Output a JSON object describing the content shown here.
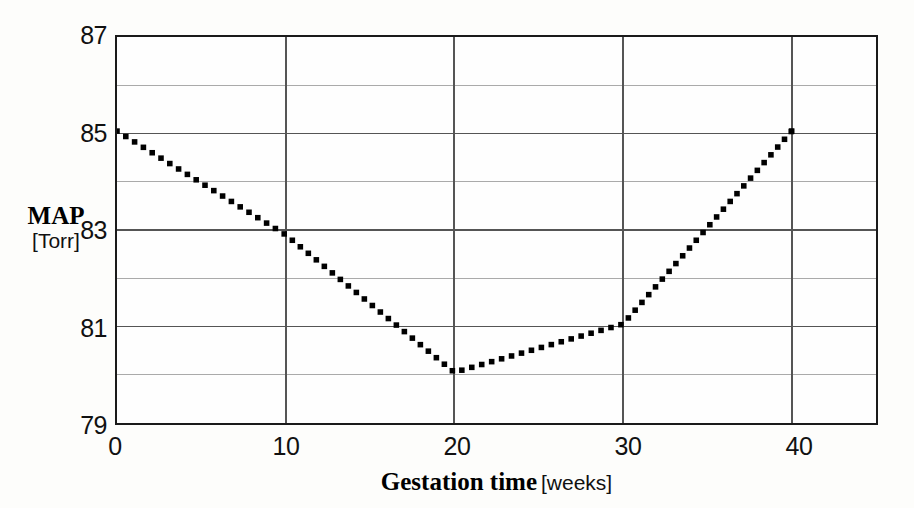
{
  "chart_data": {
    "type": "line",
    "title": "",
    "subtitle": "",
    "xlabel": "Gestation time",
    "xunit": "[weeks]",
    "ylabel": "MAP",
    "yunit": "[Torr]",
    "x": [
      0,
      10,
      20,
      30,
      40
    ],
    "values": [
      85.05,
      82.9,
      80.05,
      81.05,
      85.05
    ],
    "series": [
      {
        "name": "MAP",
        "x": [
          0,
          10,
          20,
          30,
          40
        ],
        "values": [
          85.05,
          82.9,
          80.05,
          81.05,
          85.05
        ],
        "style": "dotted",
        "color": "#000000"
      }
    ],
    "xlim": [
      0,
      45
    ],
    "ylim": [
      79,
      87
    ],
    "x_ticks": [
      0,
      10,
      20,
      30,
      40
    ],
    "x_tick_labels": [
      "0",
      "10",
      "20",
      "30",
      "40"
    ],
    "y_ticks": [
      79,
      81,
      83,
      85,
      87
    ],
    "y_tick_labels": [
      "79",
      "81",
      "83",
      "85",
      "87"
    ],
    "y_minor_ticks": [
      80,
      82,
      84,
      86
    ],
    "x_minor_ticks": [],
    "grid": true,
    "grid_major_color": "#555555",
    "grid_minor_color": "#aaaaaa",
    "legend": false,
    "legend_position": "none",
    "annotations": [],
    "frame_color": "#1a1a1a",
    "background": "#fdfdfb"
  },
  "axes": {
    "y_labels": [
      "87",
      "85",
      "83",
      "81",
      "79"
    ],
    "x_labels": [
      "0",
      "10",
      "20",
      "30",
      "40"
    ]
  }
}
